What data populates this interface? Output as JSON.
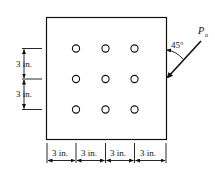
{
  "diagram": {
    "type": "bolted-connection-plate",
    "bolt_pattern": {
      "rows": 3,
      "columns": 3
    },
    "load": {
      "label": "P",
      "subscript": "u",
      "angle_label": "45°"
    },
    "vertical_dimensions": [
      "3 in.",
      "3 in."
    ],
    "horizontal_dimensions": [
      "3 in.",
      "3 in.",
      "3 in.",
      "3 in."
    ],
    "colors": {
      "line": "#111111",
      "background": "#ffffff"
    }
  }
}
